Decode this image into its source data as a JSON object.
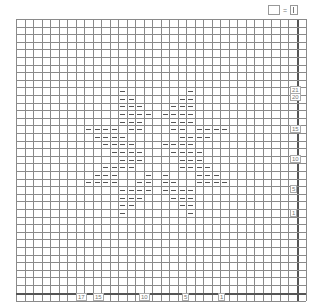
{
  "legend": {
    "items": [
      {
        "symbol": "empty-box",
        "equals": "=",
        "meaning_symbol": "knit-bar"
      }
    ]
  },
  "grid": {
    "origin_x": 0,
    "origin_y": 0,
    "cols": 33,
    "rows": 36,
    "cell_w": 8.5,
    "cell_h": 7.6,
    "label_col_w": 9,
    "label_row_h": 8,
    "line_color": "#8a8a8a",
    "thick_line_color": "#555555",
    "dash_color": "#555555"
  },
  "row_labels": [
    {
      "text": "21",
      "y": 89
    },
    {
      "text": "20",
      "y": 96
    },
    {
      "text": "15",
      "y": 128
    },
    {
      "text": "10",
      "y": 158
    },
    {
      "text": "5",
      "y": 188
    },
    {
      "text": "1",
      "y": 212
    }
  ],
  "col_labels": [
    {
      "text": "17",
      "x": 79
    },
    {
      "text": "15",
      "x": 96
    },
    {
      "text": "10",
      "x": 142
    },
    {
      "text": "5",
      "x": 185
    },
    {
      "text": "1",
      "x": 221
    }
  ],
  "pattern": {
    "symbol": "purl-dash",
    "cells": [
      [
        12,
        9
      ],
      [
        20,
        9
      ],
      [
        12,
        10
      ],
      [
        13,
        10
      ],
      [
        19,
        10
      ],
      [
        20,
        10
      ],
      [
        12,
        11
      ],
      [
        13,
        11
      ],
      [
        14,
        11
      ],
      [
        18,
        11
      ],
      [
        19,
        11
      ],
      [
        20,
        11
      ],
      [
        12,
        12
      ],
      [
        13,
        12
      ],
      [
        14,
        12
      ],
      [
        15,
        12
      ],
      [
        17,
        12
      ],
      [
        18,
        12
      ],
      [
        19,
        12
      ],
      [
        20,
        12
      ],
      [
        12,
        13
      ],
      [
        13,
        13
      ],
      [
        14,
        13
      ],
      [
        18,
        13
      ],
      [
        19,
        13
      ],
      [
        20,
        13
      ],
      [
        8,
        14
      ],
      [
        9,
        14
      ],
      [
        10,
        14
      ],
      [
        11,
        14
      ],
      [
        13,
        14
      ],
      [
        14,
        14
      ],
      [
        18,
        14
      ],
      [
        19,
        14
      ],
      [
        21,
        14
      ],
      [
        22,
        14
      ],
      [
        23,
        14
      ],
      [
        24,
        14
      ],
      [
        9,
        15
      ],
      [
        10,
        15
      ],
      [
        11,
        15
      ],
      [
        12,
        15
      ],
      [
        19,
        15
      ],
      [
        20,
        15
      ],
      [
        21,
        15
      ],
      [
        22,
        15
      ],
      [
        10,
        16
      ],
      [
        11,
        16
      ],
      [
        12,
        16
      ],
      [
        13,
        16
      ],
      [
        17,
        16
      ],
      [
        18,
        16
      ],
      [
        19,
        16
      ],
      [
        20,
        16
      ],
      [
        11,
        17
      ],
      [
        12,
        17
      ],
      [
        13,
        17
      ],
      [
        14,
        17
      ],
      [
        18,
        17
      ],
      [
        19,
        17
      ],
      [
        20,
        17
      ],
      [
        21,
        17
      ],
      [
        12,
        18
      ],
      [
        13,
        18
      ],
      [
        14,
        18
      ],
      [
        19,
        18
      ],
      [
        20,
        18
      ],
      [
        21,
        18
      ],
      [
        10,
        19
      ],
      [
        11,
        19
      ],
      [
        12,
        19
      ],
      [
        13,
        19
      ],
      [
        19,
        19
      ],
      [
        20,
        19
      ],
      [
        21,
        19
      ],
      [
        22,
        19
      ],
      [
        9,
        20
      ],
      [
        10,
        20
      ],
      [
        11,
        20
      ],
      [
        15,
        20
      ],
      [
        17,
        20
      ],
      [
        21,
        20
      ],
      [
        22,
        20
      ],
      [
        23,
        20
      ],
      [
        8,
        21
      ],
      [
        9,
        21
      ],
      [
        10,
        21
      ],
      [
        11,
        21
      ],
      [
        14,
        21
      ],
      [
        15,
        21
      ],
      [
        17,
        21
      ],
      [
        18,
        21
      ],
      [
        21,
        21
      ],
      [
        22,
        21
      ],
      [
        23,
        21
      ],
      [
        24,
        21
      ],
      [
        12,
        22
      ],
      [
        13,
        22
      ],
      [
        14,
        22
      ],
      [
        15,
        22
      ],
      [
        17,
        22
      ],
      [
        18,
        22
      ],
      [
        19,
        22
      ],
      [
        20,
        22
      ],
      [
        12,
        23
      ],
      [
        13,
        23
      ],
      [
        14,
        23
      ],
      [
        18,
        23
      ],
      [
        19,
        23
      ],
      [
        20,
        23
      ],
      [
        12,
        24
      ],
      [
        13,
        24
      ],
      [
        19,
        24
      ],
      [
        20,
        24
      ],
      [
        12,
        25
      ],
      [
        20,
        25
      ]
    ]
  }
}
